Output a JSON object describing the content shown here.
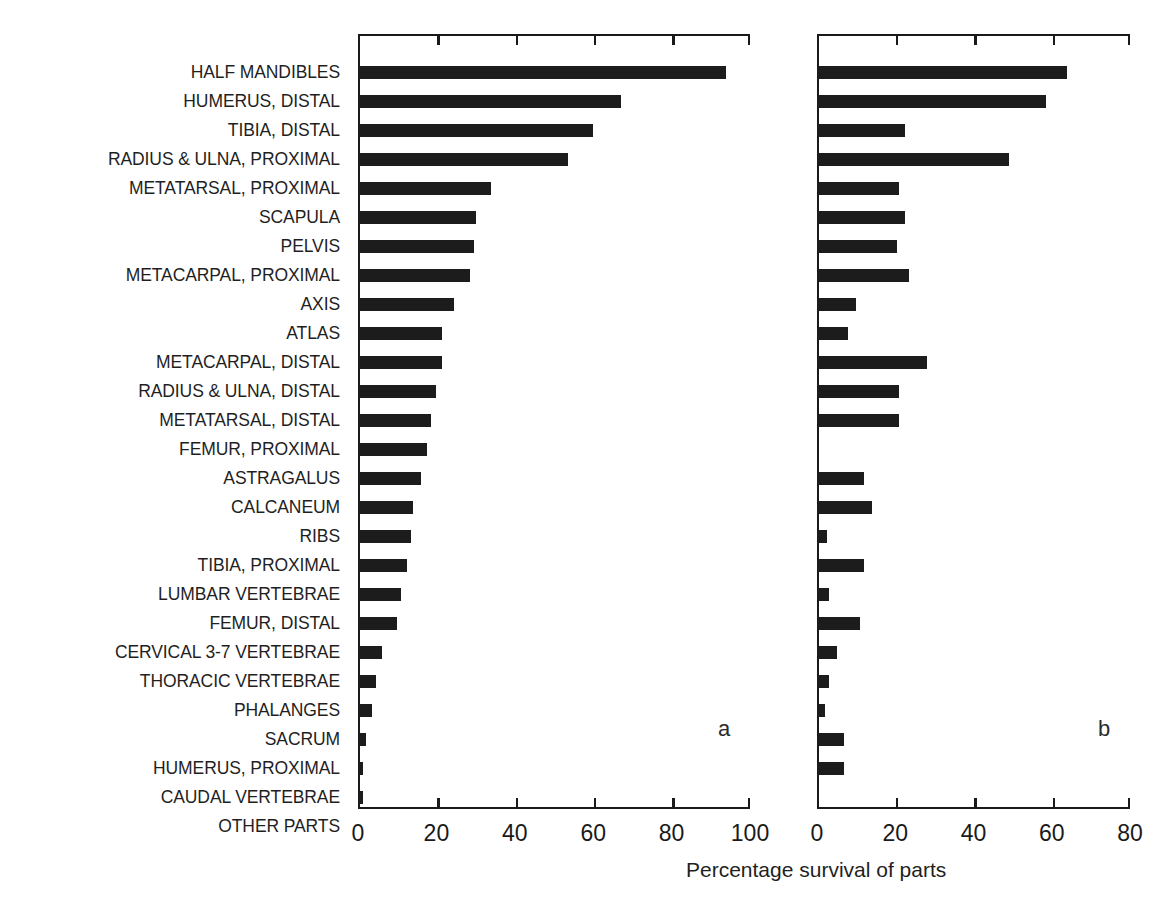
{
  "figure": {
    "axis_title": "Percentage survival of parts",
    "panel_a_letter": "a",
    "panel_b_letter": "b",
    "caption_bleed": ""
  },
  "chart_data": {
    "type": "bar",
    "orientation": "horizontal",
    "title": "",
    "xlabel": "Percentage survival of parts",
    "ylabel": "",
    "grid": false,
    "legend": "none",
    "categories": [
      "HALF MANDIBLES",
      "HUMERUS, DISTAL",
      "TIBIA, DISTAL",
      "RADIUS & ULNA, PROXIMAL",
      "METATARSAL, PROXIMAL",
      "SCAPULA",
      "PELVIS",
      "METACARPAL, PROXIMAL",
      "AXIS",
      "ATLAS",
      "METACARPAL, DISTAL",
      "RADIUS & ULNA, DISTAL",
      "METATARSAL, DISTAL",
      "FEMUR, PROXIMAL",
      "ASTRAGALUS",
      "CALCANEUM",
      "RIBS",
      "TIBIA, PROXIMAL",
      "LUMBAR VERTEBRAE",
      "FEMUR, DISTAL",
      "CERVICAL 3-7 VERTEBRAE",
      "THORACIC VERTEBRAE",
      "PHALANGES",
      "SACRUM",
      "HUMERUS, PROXIMAL",
      "CAUDAL VERTEBRAE",
      "OTHER PARTS"
    ],
    "panels": [
      {
        "letter": "a",
        "xlim": [
          0,
          100
        ],
        "xticks": [
          0,
          20,
          40,
          60,
          80,
          100
        ],
        "values": [
          94,
          67,
          60,
          53.5,
          34,
          30,
          29.5,
          28.5,
          24.5,
          21.5,
          21.5,
          20,
          18.5,
          17.5,
          16,
          14,
          13.5,
          12.5,
          11,
          10,
          6,
          4.5,
          3.5,
          2,
          1.2,
          1.3,
          0
        ]
      },
      {
        "letter": "b",
        "xlim": [
          0,
          80
        ],
        "xticks": [
          0,
          20,
          40,
          60,
          80
        ],
        "values": [
          64,
          58.5,
          22.5,
          49,
          21,
          22.5,
          20.5,
          23.5,
          10,
          8,
          28,
          21,
          21,
          0,
          12,
          14,
          2.5,
          12,
          3,
          11,
          5,
          3,
          2,
          7,
          7,
          0,
          0
        ]
      }
    ]
  }
}
